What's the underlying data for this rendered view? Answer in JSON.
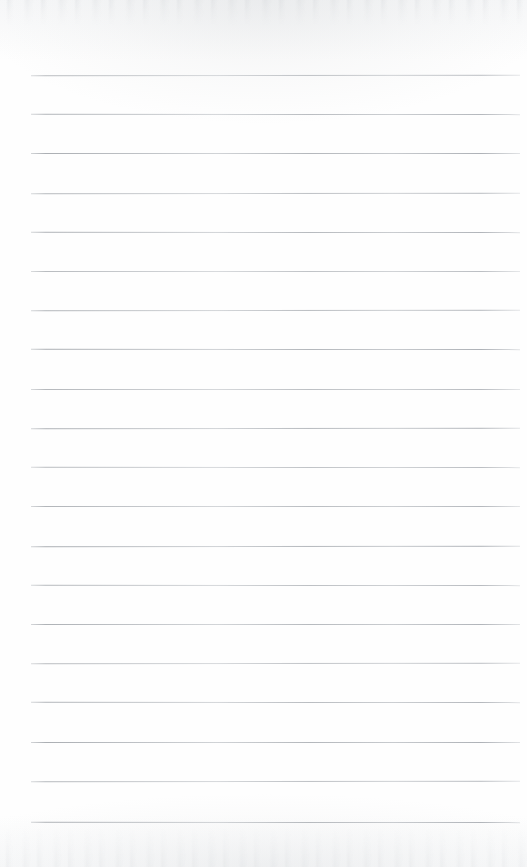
{
  "document": {
    "kind": "scanned-ruled-notebook-page",
    "title": "Blank Lined Page",
    "content_text": "",
    "page_width": 527,
    "page_height": 867,
    "paper_color": "#fefefe",
    "rule_color": "#aeb2b7",
    "has_margin_rule": false,
    "has_holes": false,
    "has_handwriting": false,
    "visible_text_items": []
  },
  "ruling": {
    "line_count": 20,
    "first_line_y": 75,
    "line_spacing": 39.2,
    "line_left_x": 31,
    "line_right_x": 520,
    "line_thickness": 1,
    "lines_y": [
      75,
      114,
      153,
      193,
      232,
      271,
      310,
      349,
      389,
      428,
      467,
      506,
      546,
      585,
      624,
      663,
      702,
      742,
      781,
      822
    ]
  },
  "scan_artifacts": {
    "top_edge_shadow": true,
    "bottom_edge_speckle": true,
    "left_margin_blank_px": 31,
    "right_margin_blank_px": 7,
    "top_margin_blank_px": 75,
    "bottom_margin_blank_px": 45
  }
}
